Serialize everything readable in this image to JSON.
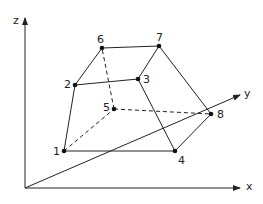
{
  "axes": {
    "x_label": "x",
    "y_label": "y",
    "z_label": "z"
  },
  "points": [
    {
      "id": "1",
      "label": "1",
      "x": 64,
      "y": 151
    },
    {
      "id": "2",
      "label": "2",
      "x": 75,
      "y": 85
    },
    {
      "id": "3",
      "label": "3",
      "x": 138,
      "y": 79
    },
    {
      "id": "4",
      "label": "4",
      "x": 175,
      "y": 151
    },
    {
      "id": "5",
      "label": "5",
      "x": 114,
      "y": 109
    },
    {
      "id": "6",
      "label": "6",
      "x": 102,
      "y": 48
    },
    {
      "id": "7",
      "label": "7",
      "x": 159,
      "y": 46
    },
    {
      "id": "8",
      "label": "8",
      "x": 211,
      "y": 114
    }
  ],
  "edges_solid": [
    [
      "1",
      "2"
    ],
    [
      "2",
      "6"
    ],
    [
      "6",
      "7"
    ],
    [
      "2",
      "3"
    ],
    [
      "3",
      "7"
    ],
    [
      "1",
      "4"
    ],
    [
      "3",
      "4"
    ],
    [
      "7",
      "8"
    ],
    [
      "4",
      "8"
    ]
  ],
  "edges_hidden": [
    [
      "1",
      "5"
    ],
    [
      "5",
      "6"
    ],
    [
      "5",
      "8"
    ]
  ],
  "colors": {
    "line": "#222222",
    "background": "#ffffff"
  }
}
